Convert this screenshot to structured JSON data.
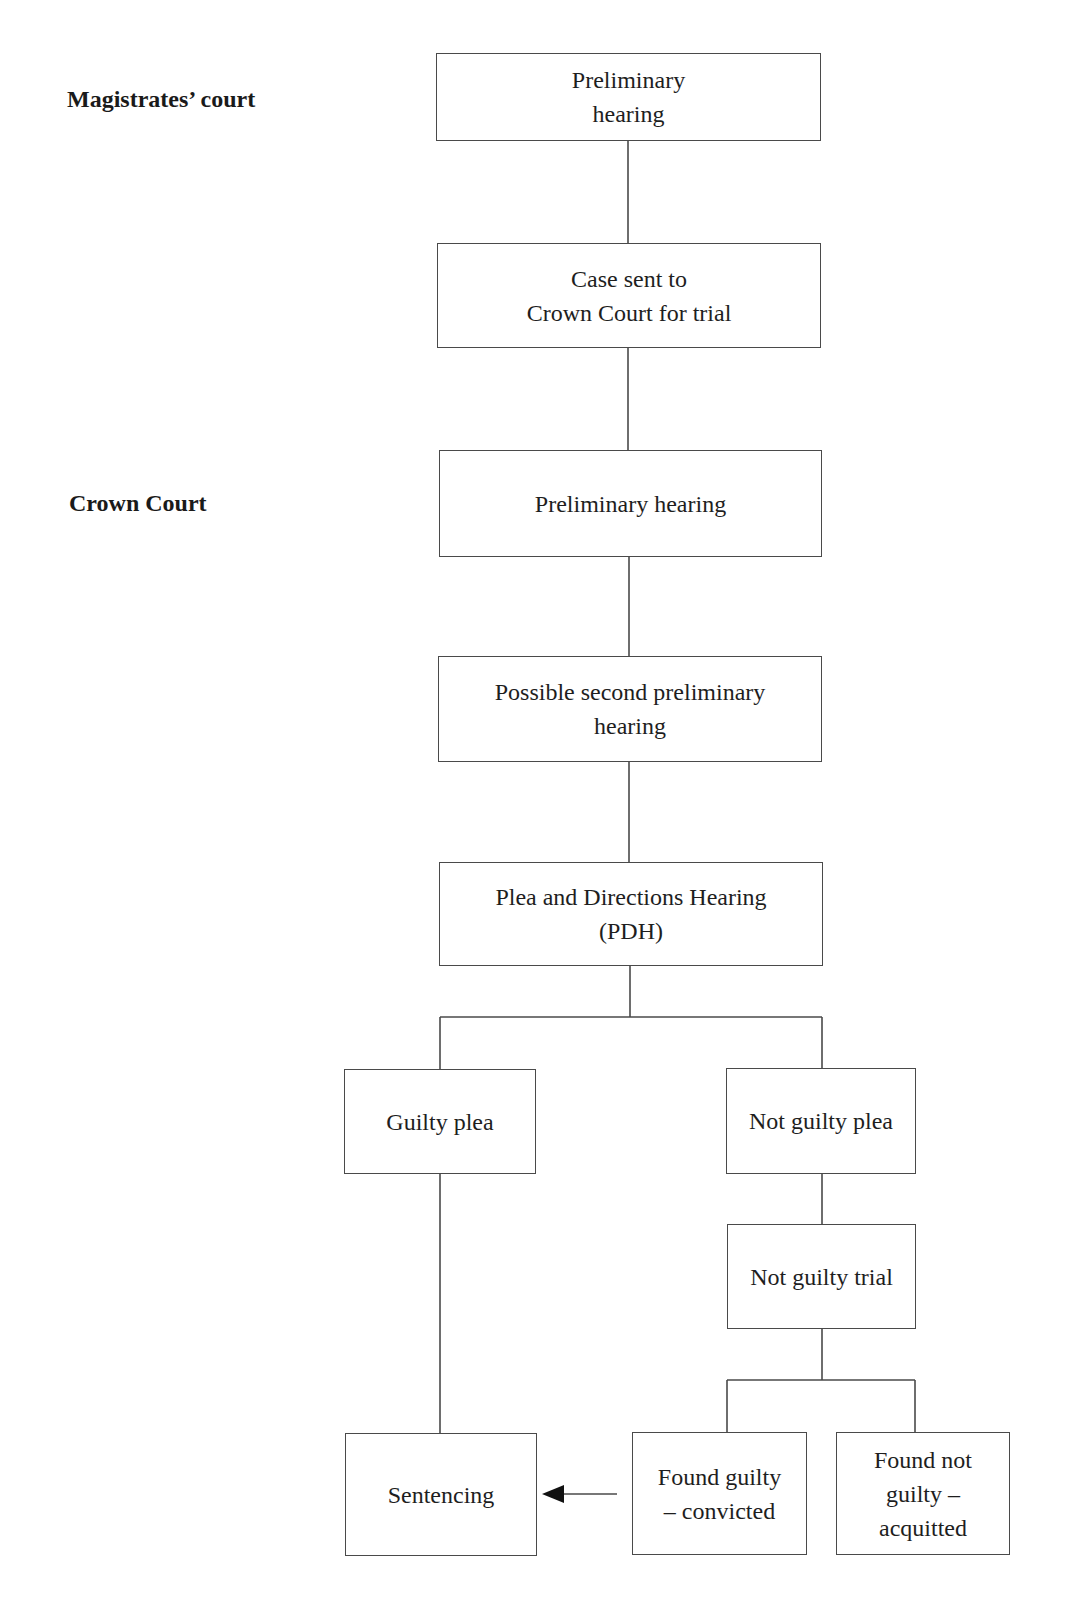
{
  "diagram": {
    "type": "flowchart",
    "stages": [
      {
        "id": "magistrates",
        "label": "Magistrates’ court"
      },
      {
        "id": "crown",
        "label": "Crown Court"
      }
    ],
    "nodes": [
      {
        "id": "mc_prelim",
        "label": "Preliminary\nhearing"
      },
      {
        "id": "sent_to_crown",
        "label": "Case sent to\nCrown Court for trial"
      },
      {
        "id": "cc_prelim",
        "label": "Preliminary hearing"
      },
      {
        "id": "second_prelim",
        "label": "Possible second preliminary\nhearing"
      },
      {
        "id": "pdh",
        "label": "Plea and Directions Hearing\n(PDH)"
      },
      {
        "id": "guilty_plea",
        "label": "Guilty plea"
      },
      {
        "id": "not_guilty_plea",
        "label": "Not guilty plea"
      },
      {
        "id": "not_guilty_trial",
        "label": "Not guilty trial"
      },
      {
        "id": "sentencing",
        "label": "Sentencing"
      },
      {
        "id": "found_guilty",
        "label": "Found guilty\n– convicted"
      },
      {
        "id": "found_not_guilty",
        "label": "Found not\nguilty –\nacquitted"
      }
    ],
    "edges": [
      {
        "from": "mc_prelim",
        "to": "sent_to_crown",
        "style": "line"
      },
      {
        "from": "sent_to_crown",
        "to": "cc_prelim",
        "style": "line"
      },
      {
        "from": "cc_prelim",
        "to": "second_prelim",
        "style": "line"
      },
      {
        "from": "second_prelim",
        "to": "pdh",
        "style": "line"
      },
      {
        "from": "pdh",
        "to": "guilty_plea",
        "style": "branch"
      },
      {
        "from": "pdh",
        "to": "not_guilty_plea",
        "style": "branch"
      },
      {
        "from": "guilty_plea",
        "to": "sentencing",
        "style": "line"
      },
      {
        "from": "not_guilty_plea",
        "to": "not_guilty_trial",
        "style": "line"
      },
      {
        "from": "not_guilty_trial",
        "to": "found_guilty",
        "style": "branch"
      },
      {
        "from": "not_guilty_trial",
        "to": "found_not_guilty",
        "style": "branch"
      },
      {
        "from": "found_guilty",
        "to": "sentencing",
        "style": "arrow"
      }
    ],
    "colors": {
      "line": "#4a4a4a",
      "text": "#1e1e1e",
      "background": "#ffffff"
    }
  }
}
